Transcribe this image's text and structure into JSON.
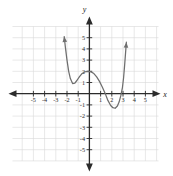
{
  "figure": {
    "title": "",
    "background_color": "#ffffff",
    "axis_color": "#2b2b2b",
    "grid_color": "#d9d9d9",
    "curve_color": "#6e6e6e",
    "label_color": "#2b2b2b"
  },
  "axes": {
    "x_axis_label": "x",
    "y_axis_label": "y",
    "x_ticks": [
      "-5",
      "-4",
      "-3",
      "-2",
      "-1",
      "1",
      "2",
      "3",
      "4",
      "5"
    ],
    "y_ticks": [
      "5",
      "4",
      "3",
      "2",
      "1",
      "-1",
      "-2",
      "-3",
      "-4",
      "-5"
    ],
    "arrowheads": [
      "left",
      "right",
      "up",
      "down"
    ]
  },
  "chart_data": {
    "type": "line",
    "title": "",
    "xlabel": "x",
    "ylabel": "y",
    "xlim": [
      -6,
      6
    ],
    "ylim": [
      -6,
      6
    ],
    "grid": true,
    "legend": "none",
    "x_ticks": [
      -5,
      -4,
      -3,
      -2,
      -1,
      1,
      2,
      3,
      4,
      5
    ],
    "y_ticks": [
      5,
      4,
      3,
      2,
      1,
      -1,
      -2,
      -3,
      -4,
      -5
    ],
    "series": [
      {
        "name": "quartic curve",
        "curve_arrows": [
          "up-left-end",
          "up-right-end"
        ],
        "features": {
          "local_min_left": [
            -1.5,
            0.9
          ],
          "local_max": [
            -0.1,
            2.0
          ],
          "local_min_right": [
            2.3,
            -1.3
          ],
          "x_intercepts": [
            -1.0,
            1.45,
            2.95
          ],
          "y_intercept": 2.0
        },
        "x": [
          -2.25,
          -2.15,
          -2.0,
          -1.85,
          -1.7,
          -1.5,
          -1.3,
          -1.1,
          -0.9,
          -0.7,
          -0.5,
          -0.3,
          -0.1,
          0.15,
          0.4,
          0.65,
          0.9,
          1.15,
          1.4,
          1.65,
          1.9,
          2.1,
          2.3,
          2.5,
          2.65,
          2.8,
          2.95,
          3.05,
          3.15,
          3.3
        ],
        "y": [
          5.1,
          4.2,
          3.0,
          2.0,
          1.35,
          0.9,
          0.95,
          1.2,
          1.5,
          1.75,
          1.9,
          1.98,
          2.0,
          1.95,
          1.8,
          1.5,
          1.1,
          0.6,
          0.05,
          -0.6,
          -1.05,
          -1.25,
          -1.3,
          -1.1,
          -0.75,
          -0.2,
          0.55,
          1.4,
          2.6,
          4.6
        ]
      }
    ]
  }
}
